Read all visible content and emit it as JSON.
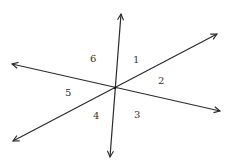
{
  "diagram": {
    "intersection": {
      "x": 115,
      "y": 88
    },
    "lines": [
      {
        "name": "line-a",
        "from": {
          "x": 110,
          "y": 157
        },
        "to": {
          "x": 121,
          "y": 14
        }
      },
      {
        "name": "line-b",
        "from": {
          "x": 12,
          "y": 64
        },
        "to": {
          "x": 220,
          "y": 111
        }
      },
      {
        "name": "line-c",
        "from": {
          "x": 13,
          "y": 141
        },
        "to": {
          "x": 217,
          "y": 34
        }
      }
    ],
    "angle_labels": [
      {
        "text": "1",
        "x": 133,
        "y": 63
      },
      {
        "text": "2",
        "x": 158,
        "y": 84
      },
      {
        "text": "3",
        "x": 134,
        "y": 118
      },
      {
        "text": "4",
        "x": 93,
        "y": 119
      },
      {
        "text": "5",
        "x": 65,
        "y": 96
      },
      {
        "text": "6",
        "x": 90,
        "y": 62
      }
    ]
  }
}
